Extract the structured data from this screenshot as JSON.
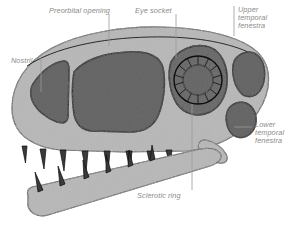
{
  "figure": {
    "background_color": "#ffffff",
    "label_color": "#8a8a8a",
    "leader_color": "#9a9a9a",
    "bone_fill": "#b8b8b8",
    "opening_fill": "#6e6e6e",
    "outline_color": "#1a1a1a"
  },
  "labels": {
    "preorbital_opening": "Preorbital opening",
    "eye_socket": "Eye socket",
    "upper_temporal_fenestra_l1": "Upper",
    "upper_temporal_fenestra_l2": "temporal",
    "upper_temporal_fenestra_l3": "fenestra",
    "nostril": "Nostril",
    "lower_temporal_fenestra_l1": "Lower",
    "lower_temporal_fenestra_l2": "temporal",
    "lower_temporal_fenestra_l3": "fenestra",
    "sclerotic_ring": "Sclerotic ring"
  },
  "anatomy": {
    "upper_jaw_tooth_count": 8,
    "lower_jaw_tooth_count": 6,
    "sclerotic_ring_plate_count": 14,
    "openings": [
      "nostril",
      "preorbital opening",
      "eye socket",
      "upper temporal fenestra",
      "lower temporal fenestra"
    ]
  }
}
